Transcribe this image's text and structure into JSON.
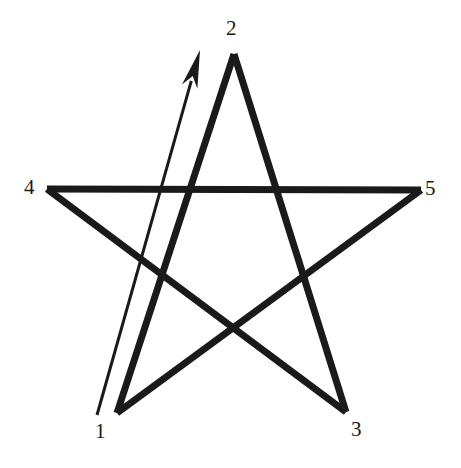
{
  "figure": {
    "name": "pentagram-unicursal-diagram",
    "background_color": "#ffffff",
    "stroke_color": "#1a1a1a",
    "width": 461,
    "height": 468
  },
  "labels": {
    "v1": "1",
    "v2": "2",
    "v3": "3",
    "v4": "4",
    "v5": "5"
  },
  "label_positions": {
    "v1": {
      "x": 95,
      "y": 421
    },
    "v2": {
      "x": 226,
      "y": 18
    },
    "v3": {
      "x": 351,
      "y": 419
    },
    "v4": {
      "x": 24,
      "y": 177
    },
    "v5": {
      "x": 425,
      "y": 178
    }
  },
  "chart_data": {
    "type": "scatter",
    "title": "",
    "xlabel": "",
    "ylabel": "",
    "vertices": [
      {
        "label": "1",
        "x": 117,
        "y": 413,
        "role": "bottom-left-point"
      },
      {
        "label": "2",
        "x": 234,
        "y": 54,
        "role": "top-point"
      },
      {
        "label": "3",
        "x": 346,
        "y": 412,
        "role": "bottom-right-point"
      },
      {
        "label": "4",
        "x": 47,
        "y": 189,
        "role": "left-point"
      },
      {
        "label": "5",
        "x": 421,
        "y": 190,
        "role": "right-point"
      }
    ],
    "stroke_order": [
      "1",
      "2",
      "3",
      "4",
      "5",
      "1"
    ],
    "segments": [
      {
        "from": "1",
        "to": "2"
      },
      {
        "from": "2",
        "to": "3"
      },
      {
        "from": "3",
        "to": "4"
      },
      {
        "from": "4",
        "to": "5"
      },
      {
        "from": "5",
        "to": "1"
      }
    ],
    "arrow": {
      "from": {
        "x": 97,
        "y": 415
      },
      "to": {
        "x": 200,
        "y": 50
      },
      "meaning": "drawing-direction-first-stroke"
    },
    "stroke_width_star": 7,
    "stroke_width_arrow": 3,
    "grid": false,
    "legend": "none"
  }
}
